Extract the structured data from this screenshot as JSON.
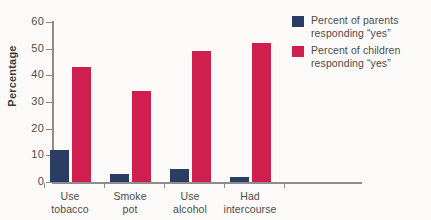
{
  "chart_data": {
    "type": "bar",
    "title": "",
    "xlabel": "",
    "ylabel": "Percentage",
    "ylim": [
      0,
      60
    ],
    "yticks": [
      0,
      10,
      20,
      30,
      40,
      50,
      60
    ],
    "grid": false,
    "legend_position": "right",
    "categories": [
      "Use tobacco",
      "Smoke pot",
      "Use alcohol",
      "Had intercourse"
    ],
    "category_lines": [
      [
        "Use",
        "tobacco"
      ],
      [
        "Smoke",
        "pot"
      ],
      [
        "Use",
        "alcohol"
      ],
      [
        "Had",
        "intercourse"
      ]
    ],
    "series": [
      {
        "name": "Percent of parents responding \"yes\"",
        "name_lines": [
          "Percent of parents",
          "responding \"yes\""
        ],
        "color": "#2b3d63",
        "values": [
          12,
          3,
          5,
          2
        ]
      },
      {
        "name": "Percent of children responding \"yes\"",
        "name_lines": [
          "Percent of children",
          "responding \"yes\""
        ],
        "color": "#ce1f4e",
        "values": [
          43,
          34,
          49,
          52
        ]
      }
    ]
  },
  "axis": {
    "y_title": "Percentage",
    "y_tick_labels": [
      "60",
      "50",
      "40",
      "30",
      "20",
      "10",
      "0"
    ]
  },
  "legend": {
    "items": [
      {
        "line1": "Percent of parents",
        "line2": "responding “yes”"
      },
      {
        "line1": "Percent of children",
        "line2": "responding “yes”"
      }
    ]
  }
}
